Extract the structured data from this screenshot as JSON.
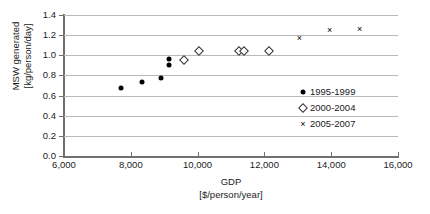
{
  "chart_data": {
    "type": "scatter",
    "title": "",
    "xlabel": "GDP",
    "xlabel_units": "[$/person/year]",
    "ylabel": "MSW generated",
    "ylabel_units": "[kg/person/day]",
    "xlim": [
      6000,
      16000
    ],
    "ylim": [
      0.0,
      1.4
    ],
    "xticks": [
      6000,
      8000,
      10000,
      12000,
      14000,
      16000
    ],
    "xtick_labels": [
      "6,000",
      "8,000",
      "10,000",
      "12,000",
      "14,000",
      "16,000"
    ],
    "yticks": [
      0.0,
      0.2,
      0.4,
      0.6,
      0.8,
      1.0,
      1.2,
      1.4
    ],
    "ytick_labels": [
      "0.0",
      "0.2",
      "0.4",
      "0.6",
      "0.8",
      "1.0",
      "1.2",
      "1.4"
    ],
    "grid": "horizontal",
    "legend_position": "center-right",
    "series": [
      {
        "name": "1995-1999",
        "marker": "filled-circle",
        "color": "#000000",
        "points": [
          {
            "x": 7700,
            "y": 0.68
          },
          {
            "x": 8350,
            "y": 0.73
          },
          {
            "x": 8900,
            "y": 0.77
          },
          {
            "x": 9150,
            "y": 0.965
          },
          {
            "x": 9150,
            "y": 0.905
          }
        ]
      },
      {
        "name": "2000-2004",
        "marker": "open-diamond",
        "color": "#303030",
        "points": [
          {
            "x": 9600,
            "y": 0.955
          },
          {
            "x": 10050,
            "y": 1.04
          },
          {
            "x": 11250,
            "y": 1.045
          },
          {
            "x": 11400,
            "y": 1.045
          },
          {
            "x": 12150,
            "y": 1.04
          }
        ]
      },
      {
        "name": "2005-2007",
        "marker": "cross",
        "color": "#000000",
        "points": [
          {
            "x": 13050,
            "y": 1.175
          },
          {
            "x": 13950,
            "y": 1.255
          },
          {
            "x": 14850,
            "y": 1.265
          }
        ]
      }
    ]
  },
  "legend": {
    "items": [
      {
        "label": "1995-1999",
        "marker": "filled-circle"
      },
      {
        "label": "2000-2004",
        "marker": "open-diamond"
      },
      {
        "label": "2005-2007",
        "marker": "cross"
      }
    ]
  },
  "symbols": {
    "cross_glyph": "×"
  }
}
